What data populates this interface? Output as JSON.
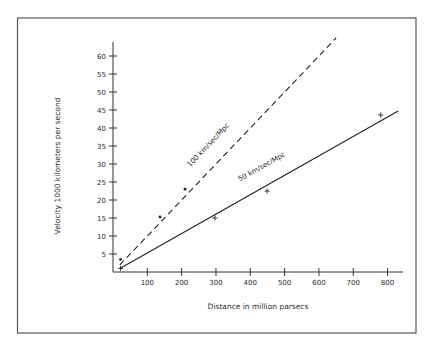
{
  "chart_data": {
    "type": "line",
    "title": "",
    "xlabel": "Distance in million parsecs",
    "ylabel": "Velocity 1000 kilometers per second",
    "xlim": [
      0,
      850
    ],
    "ylim": [
      0,
      65
    ],
    "x_ticks": [
      100,
      200,
      300,
      400,
      500,
      600,
      700,
      800
    ],
    "y_ticks": [
      5,
      10,
      15,
      20,
      25,
      30,
      35,
      40,
      45,
      50,
      55,
      60
    ],
    "grid": false,
    "legend": "none",
    "series": [
      {
        "name": "100 km/sec/Mpc",
        "style": "dashed",
        "line": {
          "x": [
            20,
            650
          ],
          "y": [
            2,
            65
          ]
        },
        "points": [
          {
            "x": 22,
            "y": 3.5
          },
          {
            "x": 137,
            "y": 15.3
          },
          {
            "x": 210,
            "y": 23
          }
        ],
        "marker": "dot"
      },
      {
        "name": "50 km/sec/Mpc",
        "style": "solid",
        "line": {
          "x": [
            20,
            831
          ],
          "y": [
            1,
            44.7
          ]
        },
        "points": [
          {
            "x": 22,
            "y": 1
          },
          {
            "x": 297,
            "y": 15
          },
          {
            "x": 449,
            "y": 22.5
          },
          {
            "x": 780,
            "y": 43.6
          }
        ],
        "marker": "plus"
      }
    ],
    "annotations": [
      {
        "text": "100 km/sec/Mpc",
        "along": "dashed line"
      },
      {
        "text": "50 km/sec/Mpc",
        "along": "solid line"
      }
    ]
  }
}
